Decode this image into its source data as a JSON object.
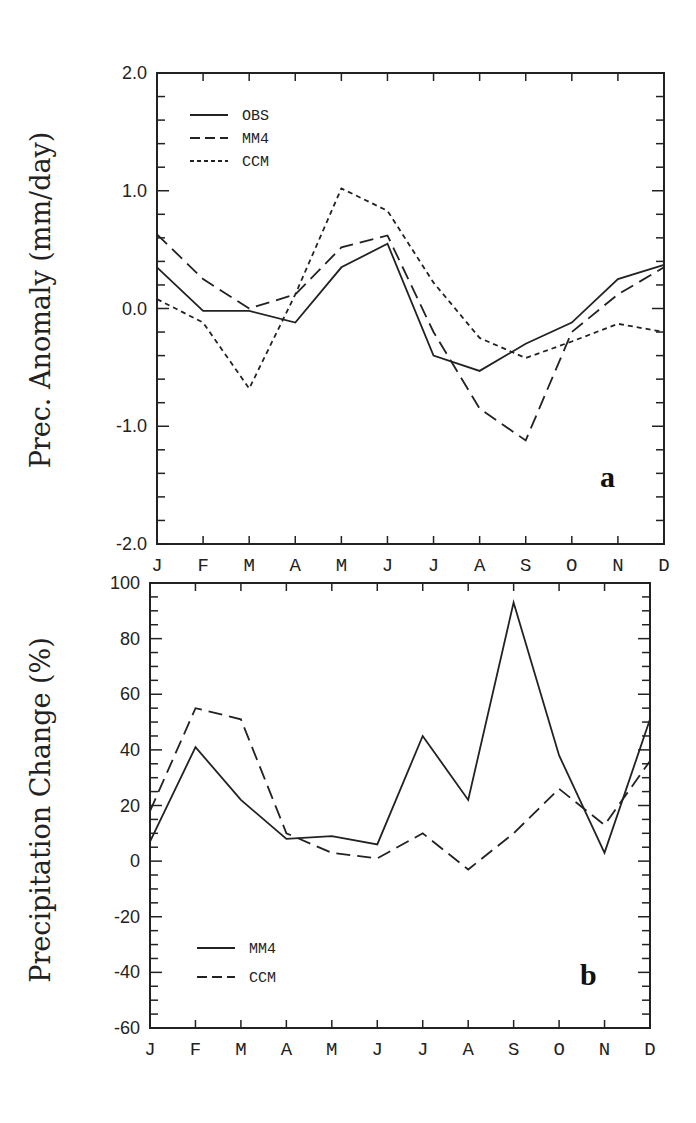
{
  "chart_data": [
    {
      "type": "line",
      "panel_label": "a",
      "title": "",
      "xlabel": "",
      "ylabel": "Prec. Anomaly (mm/day)",
      "categories": [
        "J",
        "F",
        "M",
        "A",
        "M",
        "J",
        "J",
        "A",
        "S",
        "O",
        "N",
        "D"
      ],
      "ylim": [
        -2.0,
        2.0
      ],
      "yticks": [
        "2.0",
        "1.0",
        "0.0",
        "-1.0",
        "-2.0"
      ],
      "yticks_values": [
        2.0,
        1.0,
        0.0,
        -1.0,
        -2.0
      ],
      "grid": false,
      "legend_position": "upper-left",
      "series": [
        {
          "name": "OBS",
          "style": "solid",
          "values": [
            0.35,
            -0.02,
            -0.02,
            -0.12,
            0.35,
            0.55,
            -0.4,
            -0.53,
            -0.3,
            -0.12,
            0.25,
            0.37
          ]
        },
        {
          "name": "MM4",
          "style": "dashed",
          "values": [
            0.63,
            0.25,
            0.0,
            0.12,
            0.52,
            0.62,
            -0.2,
            -0.85,
            -1.12,
            -0.2,
            0.12,
            0.35
          ]
        },
        {
          "name": "CCM",
          "style": "dotted",
          "values": [
            0.08,
            -0.12,
            -0.68,
            0.12,
            1.02,
            0.83,
            0.22,
            -0.25,
            -0.42,
            -0.28,
            -0.13,
            -0.2
          ]
        }
      ]
    },
    {
      "type": "line",
      "panel_label": "b",
      "title": "",
      "xlabel": "",
      "ylabel": "Precipitation Change (%)",
      "categories": [
        "J",
        "F",
        "M",
        "A",
        "M",
        "J",
        "J",
        "A",
        "S",
        "O",
        "N",
        "D"
      ],
      "ylim": [
        -60,
        100
      ],
      "yticks": [
        "100",
        "80",
        "60",
        "40",
        "20",
        "0",
        "-20",
        "-40",
        "-60"
      ],
      "yticks_values": [
        100,
        80,
        60,
        40,
        20,
        0,
        -20,
        -40,
        -60
      ],
      "grid": false,
      "legend_position": "lower-left",
      "series": [
        {
          "name": "MM4",
          "style": "solid",
          "values": [
            7,
            41,
            22,
            8,
            9,
            6,
            45,
            22,
            93,
            38,
            3,
            51
          ]
        },
        {
          "name": "CCM",
          "style": "dashed",
          "values": [
            18,
            55,
            51,
            10,
            3,
            1,
            10,
            -3,
            10,
            26,
            13,
            36
          ]
        }
      ]
    }
  ]
}
